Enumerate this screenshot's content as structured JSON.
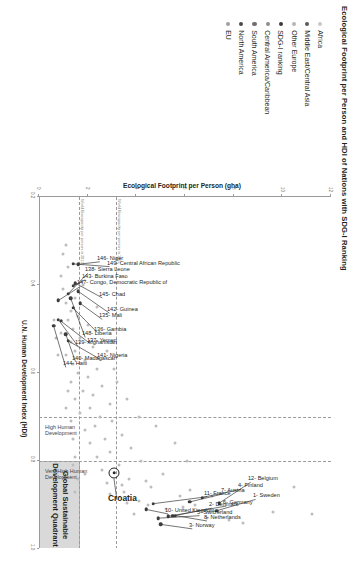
{
  "figure": {
    "title": "Ecological Footprint per Person and HDI of Nations with SDG-I Ranking"
  },
  "legend": {
    "items": [
      {
        "label": "Africa",
        "color": "#c9c9c9"
      },
      {
        "label": "Middle East/Central Asia",
        "color": "#5a5a5a"
      },
      {
        "label": "Other Europe",
        "color": "#b5b5b5"
      },
      {
        "label": "SDG-I ranking",
        "color": "#3b3b3b"
      },
      {
        "label": "Central America/Caribbean",
        "color": "#8e8e8e"
      },
      {
        "label": "South America",
        "color": "#6f6f6f"
      },
      {
        "label": "North America",
        "color": "#4a4a4a"
      },
      {
        "label": "EU",
        "color": "#a0a0a0"
      }
    ]
  },
  "annotations": {
    "quadrant_label_line1": "Global Sustainable",
    "quadrant_label_line2": "Development Quadrant",
    "band_very_high": "Very High Human\nDevelopment",
    "band_high": "High Human\nDevelopment",
    "biocapacity": "World Biocapacity per person in 1961",
    "biocapacity2": "World Biocapacity per person in 2012",
    "croatia": "Croatia"
  },
  "chart_data": {
    "type": "scatter",
    "title": "Ecological Footprint per Person and HDI of Nations with SDG-I Ranking",
    "xlabel": "U.N. Human Development Index (HDI)",
    "ylabel": "Ecological Footprint per Person (gha)",
    "xlim": [
      0.2,
      1.0
    ],
    "ylim": [
      0,
      12
    ],
    "xticks": [
      0.2,
      0.4,
      0.6,
      0.8,
      1.0
    ],
    "yticks": [
      0,
      2,
      4,
      6,
      8,
      10,
      12
    ],
    "grid": false,
    "legend_position": "left",
    "reference_lines": {
      "hdi_very_high_threshold": 0.8,
      "hdi_high_threshold": 0.7,
      "biocapacity_1961": 3.2,
      "biocapacity_2012": 1.7
    },
    "sustainable_quadrant": {
      "x_range": [
        0.8,
        1.0
      ],
      "y_range": [
        0,
        1.7
      ]
    },
    "highlighted": {
      "name": "Croatia",
      "hdi": 0.827,
      "footprint": 3.1
    },
    "labeled_points": [
      {
        "label": "1- Sweden",
        "hdi": 0.913,
        "footprint": 7.3
      },
      {
        "label": "2- Denmark",
        "hdi": 0.925,
        "footprint": 5.5
      },
      {
        "label": "3- Norway",
        "hdi": 0.944,
        "footprint": 5.0
      },
      {
        "label": "4- Finland",
        "hdi": 0.883,
        "footprint": 6.7
      },
      {
        "label": "5- Switzerland",
        "hdi": 0.93,
        "footprint": 4.9
      },
      {
        "label": "6- Germany",
        "hdi": 0.926,
        "footprint": 5.3
      },
      {
        "label": "7- Austria",
        "hdi": 0.893,
        "footprint": 6.2
      },
      {
        "label": "8- Netherlands",
        "hdi": 0.924,
        "footprint": 5.6
      },
      {
        "label": "10- United Kingdom",
        "hdi": 0.91,
        "footprint": 4.4
      },
      {
        "label": "11- France",
        "hdi": 0.897,
        "footprint": 4.7
      },
      {
        "label": "12- Belgium",
        "hdi": 0.896,
        "footprint": 7.4
      },
      {
        "label": "135- Mali",
        "hdi": 0.442,
        "footprint": 1.7
      },
      {
        "label": "136- Gambia",
        "hdi": 0.452,
        "footprint": 1.4
      },
      {
        "label": "137- Yemen",
        "hdi": 0.482,
        "footprint": 0.9
      },
      {
        "label": "138- Sierra Leone",
        "hdi": 0.42,
        "footprint": 1.2
      },
      {
        "label": "139- Afghanistan",
        "hdi": 0.479,
        "footprint": 0.8
      },
      {
        "label": "140- Madagascar",
        "hdi": 0.512,
        "footprint": 1.1
      },
      {
        "label": "141- Nigeria",
        "hdi": 0.527,
        "footprint": 1.2
      },
      {
        "label": "142- Guinea",
        "hdi": 0.414,
        "footprint": 1.6
      },
      {
        "label": "143- Burkina Faso",
        "hdi": 0.402,
        "footprint": 1.4
      },
      {
        "label": "144- Haiti",
        "hdi": 0.493,
        "footprint": 0.6
      },
      {
        "label": "145- Chad",
        "hdi": 0.396,
        "footprint": 1.5
      },
      {
        "label": "146- Niger",
        "hdi": 0.353,
        "footprint": 1.6
      },
      {
        "label": "147- Congo, Democratic Republic of",
        "hdi": 0.435,
        "footprint": 0.8
      },
      {
        "label": "148- Liberia",
        "hdi": 0.43,
        "footprint": 1.3
      },
      {
        "label": "149- Central African Republic",
        "hdi": 0.352,
        "footprint": 1.4
      }
    ],
    "unlabeled_points": [
      {
        "hdi": 0.31,
        "footprint": 1.1
      },
      {
        "hdi": 0.33,
        "footprint": 1.0
      },
      {
        "hdi": 0.36,
        "footprint": 1.2
      },
      {
        "hdi": 0.38,
        "footprint": 0.9
      },
      {
        "hdi": 0.4,
        "footprint": 1.8
      },
      {
        "hdi": 0.41,
        "footprint": 1.0
      },
      {
        "hdi": 0.43,
        "footprint": 1.5
      },
      {
        "hdi": 0.44,
        "footprint": 1.1
      },
      {
        "hdi": 0.46,
        "footprint": 1.3
      },
      {
        "hdi": 0.47,
        "footprint": 1.6
      },
      {
        "hdi": 0.48,
        "footprint": 1.2
      },
      {
        "hdi": 0.49,
        "footprint": 2.0
      },
      {
        "hdi": 0.5,
        "footprint": 1.4
      },
      {
        "hdi": 0.51,
        "footprint": 0.9
      },
      {
        "hdi": 0.52,
        "footprint": 1.7
      },
      {
        "hdi": 0.53,
        "footprint": 1.3
      },
      {
        "hdi": 0.54,
        "footprint": 2.2
      },
      {
        "hdi": 0.55,
        "footprint": 1.5
      },
      {
        "hdi": 0.56,
        "footprint": 1.1
      },
      {
        "hdi": 0.57,
        "footprint": 1.9
      },
      {
        "hdi": 0.58,
        "footprint": 1.4
      },
      {
        "hdi": 0.59,
        "footprint": 2.4
      },
      {
        "hdi": 0.6,
        "footprint": 1.6
      },
      {
        "hdi": 0.61,
        "footprint": 2.0
      },
      {
        "hdi": 0.62,
        "footprint": 1.3
      },
      {
        "hdi": 0.63,
        "footprint": 2.6
      },
      {
        "hdi": 0.64,
        "footprint": 1.8
      },
      {
        "hdi": 0.65,
        "footprint": 2.2
      },
      {
        "hdi": 0.66,
        "footprint": 1.5
      },
      {
        "hdi": 0.67,
        "footprint": 2.9
      },
      {
        "hdi": 0.68,
        "footprint": 2.1
      },
      {
        "hdi": 0.69,
        "footprint": 1.7
      },
      {
        "hdi": 0.7,
        "footprint": 2.5
      },
      {
        "hdi": 0.71,
        "footprint": 3.0
      },
      {
        "hdi": 0.72,
        "footprint": 2.3
      },
      {
        "hdi": 0.73,
        "footprint": 1.9
      },
      {
        "hdi": 0.74,
        "footprint": 3.4
      },
      {
        "hdi": 0.75,
        "footprint": 2.7
      },
      {
        "hdi": 0.76,
        "footprint": 2.1
      },
      {
        "hdi": 0.77,
        "footprint": 3.8
      },
      {
        "hdi": 0.78,
        "footprint": 2.9
      },
      {
        "hdi": 0.79,
        "footprint": 2.4
      },
      {
        "hdi": 0.8,
        "footprint": 4.2
      },
      {
        "hdi": 0.81,
        "footprint": 3.3
      },
      {
        "hdi": 0.82,
        "footprint": 2.6
      },
      {
        "hdi": 0.83,
        "footprint": 5.1
      },
      {
        "hdi": 0.84,
        "footprint": 3.7
      },
      {
        "hdi": 0.85,
        "footprint": 2.8
      },
      {
        "hdi": 0.86,
        "footprint": 4.6
      },
      {
        "hdi": 0.87,
        "footprint": 3.5
      },
      {
        "hdi": 0.88,
        "footprint": 5.8
      },
      {
        "hdi": 0.89,
        "footprint": 4.1
      },
      {
        "hdi": 0.9,
        "footprint": 6.4
      },
      {
        "hdi": 0.91,
        "footprint": 5.2
      },
      {
        "hdi": 0.92,
        "footprint": 3.9
      },
      {
        "hdi": 0.93,
        "footprint": 6.9
      },
      {
        "hdi": 0.94,
        "footprint": 8.4
      },
      {
        "hdi": 0.915,
        "footprint": 9.6
      },
      {
        "hdi": 0.92,
        "footprint": 11.2
      },
      {
        "hdi": 0.86,
        "footprint": 10.5
      },
      {
        "hdi": 0.72,
        "footprint": 4.8
      },
      {
        "hdi": 0.76,
        "footprint": 5.6
      },
      {
        "hdi": 0.8,
        "footprint": 6.1
      },
      {
        "hdi": 0.66,
        "footprint": 3.6
      },
      {
        "hdi": 0.7,
        "footprint": 4.1
      },
      {
        "hdi": 0.62,
        "footprint": 3.2
      },
      {
        "hdi": 0.55,
        "footprint": 2.8
      },
      {
        "hdi": 0.59,
        "footprint": 3.1
      },
      {
        "hdi": 0.45,
        "footprint": 2.4
      },
      {
        "hdi": 0.84,
        "footprint": 1.6
      },
      {
        "hdi": 0.87,
        "footprint": 1.5
      },
      {
        "hdi": 0.81,
        "footprint": 1.4
      },
      {
        "hdi": 0.83,
        "footprint": 1.9
      },
      {
        "hdi": 0.79,
        "footprint": 1.5
      },
      {
        "hdi": 0.75,
        "footprint": 1.4
      },
      {
        "hdi": 0.71,
        "footprint": 1.3
      },
      {
        "hdi": 0.68,
        "footprint": 1.1
      },
      {
        "hdi": 0.64,
        "footprint": 1.2
      },
      {
        "hdi": 0.56,
        "footprint": 0.8
      },
      {
        "hdi": 0.52,
        "footprint": 0.7
      },
      {
        "hdi": 0.48,
        "footprint": 0.6
      },
      {
        "hdi": 0.935,
        "footprint": 7.8
      },
      {
        "hdi": 0.9,
        "footprint": 4.5
      },
      {
        "hdi": 0.895,
        "footprint": 3.6
      },
      {
        "hdi": 0.875,
        "footprint": 2.9
      },
      {
        "hdi": 0.855,
        "footprint": 3.4
      },
      {
        "hdi": 0.845,
        "footprint": 4.4
      },
      {
        "hdi": 0.905,
        "footprint": 5.9
      },
      {
        "hdi": 0.88,
        "footprint": 7.1
      },
      {
        "hdi": 0.865,
        "footprint": 6.2
      }
    ]
  }
}
